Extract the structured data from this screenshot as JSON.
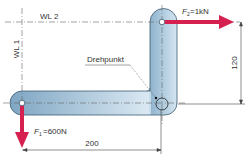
{
  "diagram": {
    "type": "angle-lever",
    "labels": {
      "wl1": "WL 1",
      "wl2": "WL 2",
      "pivot": "Drehpunkt",
      "f1_symbol": "F",
      "f1_sub": "1",
      "f1_value": "=600N",
      "f2_symbol": "F",
      "f2_sub": "2",
      "f2_value": "=1kN",
      "dim_horizontal": "200",
      "dim_vertical": "120"
    },
    "forces": [
      {
        "name": "F1",
        "magnitude": "600N",
        "direction": "down"
      },
      {
        "name": "F2",
        "magnitude": "1kN",
        "direction": "right"
      }
    ],
    "dimensions": [
      {
        "name": "lever-arm-horizontal",
        "value": 200
      },
      {
        "name": "lever-arm-vertical",
        "value": 120
      }
    ],
    "colors": {
      "lever_fill_dark": "#7fa6c3",
      "lever_fill_light": "#dbe9f3",
      "lever_stroke": "#3c5a70",
      "arrow": "#d6204f",
      "line": "#555555"
    }
  }
}
